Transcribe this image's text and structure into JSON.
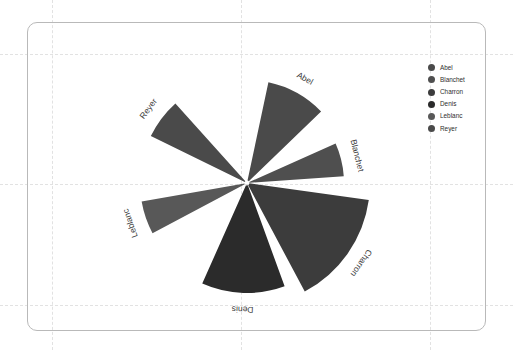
{
  "card": {
    "border_color": "#b9b9b9",
    "background": "#ffffff"
  },
  "grid": {
    "color": "#e2e2e2",
    "style": "dashed",
    "vertical_x": [
      52,
      241,
      430
    ],
    "horizontal_y": [
      54,
      184,
      305
    ]
  },
  "legend": {
    "position": "right",
    "items": [
      {
        "label": "Abel",
        "color": "#4a4a4a"
      },
      {
        "label": "Blanchet",
        "color": "#4f4f4f"
      },
      {
        "label": "Charron",
        "color": "#3c3c3c"
      },
      {
        "label": "Denis",
        "color": "#2b2b2b"
      },
      {
        "label": "Leblanc",
        "color": "#585858"
      },
      {
        "label": "Reyer",
        "color": "#4a4a4a"
      }
    ]
  },
  "chart_data": {
    "type": "pie",
    "subtype": "rose-nightingale",
    "title": "",
    "xlabel": "",
    "ylabel": "",
    "center": {
      "x": 247,
      "y": 183
    },
    "categories": [
      "Abel",
      "Blanchet",
      "Charron",
      "Denis",
      "Leblanc",
      "Reyer"
    ],
    "values": [
      103,
      97,
      123,
      110,
      107,
      107
    ],
    "radii": [
      103,
      97,
      123,
      110,
      107,
      107
    ],
    "angles_deg": [
      {
        "name": "Abel",
        "start": -78,
        "end": -44,
        "mid": -61,
        "sweep": 34
      },
      {
        "name": "Blanchet",
        "start": -24,
        "end": -4,
        "mid": -14,
        "sweep": 20
      },
      {
        "name": "Charron",
        "start": 8,
        "end": 62,
        "mid": 35,
        "sweep": 54
      },
      {
        "name": "Denis",
        "start": 70,
        "end": 114,
        "mid": 92,
        "sweep": 44
      },
      {
        "name": "Leblanc",
        "start": 152,
        "end": 170,
        "mid": 161,
        "sweep": 18
      },
      {
        "name": "Reyer",
        "start": -154,
        "end": -132,
        "mid": -143,
        "sweep": 22
      }
    ],
    "colors": [
      "#4a4a4a",
      "#4f4f4f",
      "#3c3c3c",
      "#2b2b2b",
      "#585858",
      "#4a4a4a"
    ],
    "labels_shown": true,
    "grid": true,
    "legend_position": "right"
  }
}
